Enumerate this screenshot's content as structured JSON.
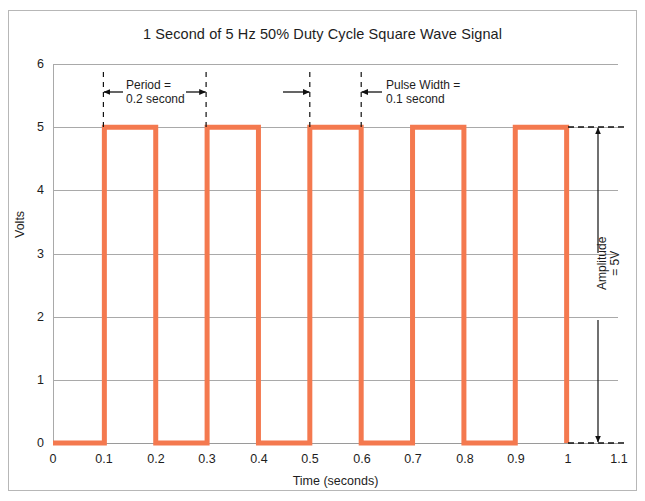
{
  "chart_data": {
    "type": "line",
    "title": "1 Second of 5 Hz 50% Duty Cycle Square Wave Signal",
    "xlabel": "Time (seconds)",
    "ylabel": "Volts",
    "xlim": [
      0,
      1.1
    ],
    "ylim": [
      0,
      6
    ],
    "grid": true,
    "legend": "none",
    "x_ticks": [
      "0",
      "0.1",
      "0.2",
      "0.3",
      "0.4",
      "0.5",
      "0.6",
      "0.7",
      "0.8",
      "0.9",
      "1",
      "1.1"
    ],
    "x_tick_values": [
      0,
      0.1,
      0.2,
      0.3,
      0.4,
      0.5,
      0.6,
      0.7,
      0.8,
      0.9,
      1,
      1.1
    ],
    "y_ticks": [
      "0",
      "1",
      "2",
      "3",
      "4",
      "5",
      "6"
    ],
    "y_tick_values": [
      0,
      1,
      2,
      3,
      4,
      5,
      6
    ],
    "series": [
      {
        "name": "5 Hz 50% duty cycle square wave",
        "color": "#F4794F",
        "frequency_hz": 5,
        "duty_cycle_percent": 50,
        "amplitude_v": 5,
        "period_s": 0.2,
        "pulse_width_s": 0.1,
        "low_level_v": 0,
        "high_level_v": 5,
        "points": [
          [
            0.0,
            0
          ],
          [
            0.1,
            0
          ],
          [
            0.1,
            5
          ],
          [
            0.2,
            5
          ],
          [
            0.2,
            0
          ],
          [
            0.3,
            0
          ],
          [
            0.3,
            5
          ],
          [
            0.4,
            5
          ],
          [
            0.4,
            0
          ],
          [
            0.5,
            0
          ],
          [
            0.5,
            5
          ],
          [
            0.6,
            5
          ],
          [
            0.6,
            0
          ],
          [
            0.7,
            0
          ],
          [
            0.7,
            5
          ],
          [
            0.8,
            5
          ],
          [
            0.8,
            0
          ],
          [
            0.9,
            0
          ],
          [
            0.9,
            5
          ],
          [
            1.0,
            5
          ],
          [
            1.0,
            0
          ]
        ]
      }
    ],
    "annotations": [
      {
        "id": "period",
        "text": "Period =\n0.2 second",
        "measure_from_x": 0.1,
        "measure_to_x": 0.3,
        "orientation": "horizontal",
        "value": "0.2 second"
      },
      {
        "id": "pulse-width",
        "text": "Pulse Width =\n0.1 second",
        "measure_from_x": 0.5,
        "measure_to_x": 0.6,
        "orientation": "horizontal",
        "value": "0.1 second"
      },
      {
        "id": "amplitude",
        "text": "Amplitude\n= 5V",
        "measure_from_y": 0,
        "measure_to_y": 5,
        "orientation": "vertical",
        "value": "5V"
      }
    ]
  },
  "figure": {
    "title": "1 Second of 5 Hz 50% Duty Cycle Square Wave Signal",
    "x_axis_title": "Time (seconds)",
    "y_axis_title": "Volts",
    "x_tick_labels": [
      "0",
      "0.1",
      "0.2",
      "0.3",
      "0.4",
      "0.5",
      "0.6",
      "0.7",
      "0.8",
      "0.9",
      "1",
      "1.1"
    ],
    "y_tick_labels": [
      "0",
      "1",
      "2",
      "3",
      "4",
      "5",
      "6"
    ],
    "annotation_period": "Period =\n0.2 second",
    "annotation_pulse_width": "Pulse Width =\n0.1 second",
    "annotation_amplitude": "Amplitude\n= 5V"
  },
  "colors": {
    "waveform": "#F4794F",
    "grid": "#a9a9a9",
    "frame": "#b7b7b7",
    "text": "#1d1d1d",
    "annotation": "#111111"
  }
}
